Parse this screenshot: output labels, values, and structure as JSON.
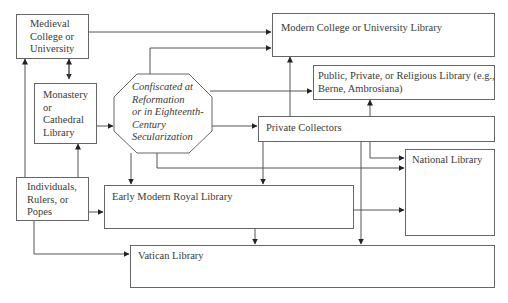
{
  "diagram": {
    "nodes": {
      "medieval": {
        "lines": [
          "Medieval",
          "College or",
          "University"
        ]
      },
      "monastery": {
        "lines": [
          "Monastery",
          "or",
          "Cathedral",
          "Library"
        ]
      },
      "confiscated": {
        "lines": [
          "Confiscated at",
          "Reformation",
          "or in Eighteenth-",
          "Century",
          "Secularization"
        ]
      },
      "individuals": {
        "lines": [
          "Individuals,",
          "Rulers, or",
          "Popes"
        ]
      },
      "modern_college": {
        "label": "Modern College or University Library"
      },
      "public": {
        "lines": [
          "Public, Private, or Religious Library (e.g.,",
          "Berne, Ambrosiana)"
        ]
      },
      "private_collectors": {
        "label": "Private Collectors"
      },
      "national": {
        "label": "National Library"
      },
      "royal": {
        "label": "Early Modern Royal Library"
      },
      "vatican": {
        "label": "Vatican Library"
      }
    },
    "edges": [
      {
        "from": "Medieval College or University",
        "to": "Modern College or University Library"
      },
      {
        "from": "Medieval College or University",
        "to": "Monastery or Cathedral Library",
        "bidirectional": true
      },
      {
        "from": "Individuals, Rulers, or Popes",
        "to": "Medieval College or University"
      },
      {
        "from": "Individuals, Rulers, or Popes",
        "to": "Monastery or Cathedral Library"
      },
      {
        "from": "Individuals, Rulers, or Popes",
        "to": "Early Modern Royal Library"
      },
      {
        "from": "Individuals, Rulers, or Popes",
        "to": "Vatican Library"
      },
      {
        "from": "Monastery or Cathedral Library",
        "to": "Confiscated at Reformation or in Eighteenth-Century Secularization"
      },
      {
        "from": "Confiscated",
        "to": "Modern College or University Library"
      },
      {
        "from": "Confiscated",
        "to": "Public, Private, or Religious Library"
      },
      {
        "from": "Confiscated",
        "to": "Private Collectors"
      },
      {
        "from": "Confiscated",
        "to": "Early Modern Royal Library"
      },
      {
        "from": "Confiscated",
        "to": "National Library"
      },
      {
        "from": "Private Collectors",
        "to": "Modern College or University Library"
      },
      {
        "from": "Private Collectors",
        "to": "Public, Private, or Religious Library"
      },
      {
        "from": "Private Collectors",
        "to": "National Library"
      },
      {
        "from": "Private Collectors",
        "to": "Early Modern Royal Library"
      },
      {
        "from": "Private Collectors",
        "to": "Vatican Library"
      },
      {
        "from": "Early Modern Royal Library",
        "to": "National Library"
      },
      {
        "from": "Early Modern Royal Library",
        "to": "Vatican Library"
      }
    ]
  }
}
